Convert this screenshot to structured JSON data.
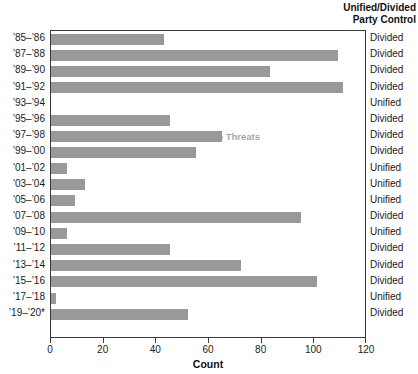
{
  "header": {
    "line1": "Unified/Divided",
    "line2": "Party Control"
  },
  "annotations": {
    "vetoes": "Vetoes",
    "veto_threats": "Veto Threats"
  },
  "colors": {
    "bar": "#999999",
    "annotation_text": "#a8a8a8",
    "axis": "#3a3a3a",
    "text": "#1a1a1a"
  },
  "chart_data": {
    "type": "bar",
    "orientation": "horizontal",
    "title": "",
    "xlabel": "Count",
    "ylabel": "",
    "xlim": [
      0,
      120
    ],
    "xticks": [
      0,
      20,
      40,
      60,
      80,
      100,
      120
    ],
    "xticklabels": [
      "0",
      "20",
      "40",
      "60",
      "80",
      "100",
      "120"
    ],
    "grid": false,
    "legend": null,
    "categories": [
      "’85–’86",
      "’87–’88",
      "’89–’90",
      "’91–’92",
      "’93–’94",
      "’95–’96",
      "’97–’98",
      "’99–’00",
      "’01–’02",
      "’03–’04",
      "’05–’06",
      "’07–’08",
      "’09–’10",
      "’11–’12",
      "’13–’14",
      "’15–’16",
      "’17–’18",
      "’19–’20*"
    ],
    "values": [
      43,
      109,
      83,
      111,
      0,
      45,
      65,
      55,
      6,
      13,
      9,
      95,
      6,
      45,
      72,
      101,
      2,
      52
    ],
    "annotations": [
      {
        "text": "Vetoes",
        "x": 22,
        "y_category": "’93–’94"
      },
      {
        "text": "Veto Threats",
        "x": 56,
        "y_category": "’93–’94"
      }
    ],
    "party_control": [
      "Divided",
      "Divided",
      "Divided",
      "Divided",
      "Unified",
      "Divided",
      "Divided",
      "Divided",
      "Unified",
      "Unified",
      "Unified",
      "Divided",
      "Unified",
      "Divided",
      "Divided",
      "Divided",
      "Unified",
      "Divided"
    ]
  }
}
